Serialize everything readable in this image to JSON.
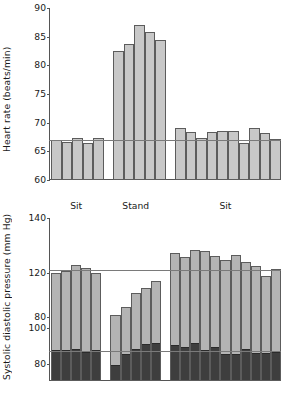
{
  "figure": {
    "panels": [
      "heart-rate",
      "blood-pressure"
    ],
    "phase_labels": [
      "Sit",
      "Stand",
      "Sit"
    ]
  },
  "chart_data": [
    {
      "type": "bar",
      "id": "heart-rate",
      "title": "",
      "xlabel": "",
      "ylabel": "Heart rate (beats/min)",
      "ylim": [
        60,
        90
      ],
      "yticks": [
        60,
        65,
        70,
        75,
        80,
        85,
        90
      ],
      "grid": false,
      "legend": "none",
      "reference_lines": [
        67.0
      ],
      "groups": [
        {
          "name": "Sit",
          "values": [
            67.0,
            66.7,
            67.3,
            66.5,
            67.3
          ]
        },
        {
          "name": "Stand",
          "values": [
            82.5,
            83.8,
            87.0,
            85.8,
            84.4
          ]
        },
        {
          "name": "Sit",
          "values": [
            69.1,
            68.4,
            67.3,
            68.4,
            68.6,
            68.6,
            66.5,
            69.0,
            68.2,
            67.1
          ]
        }
      ]
    },
    {
      "type": "bar",
      "id": "blood-pressure",
      "title": "",
      "xlabel": "",
      "ylabel": "Systolic diastolic pressure (mm Hg)",
      "stacked": true,
      "grid": false,
      "legend": "none",
      "broken_axis": true,
      "systolic_axis": {
        "ylim": [
          72,
          140
        ],
        "yticks": [
          80,
          100,
          120,
          140
        ]
      },
      "diastolic_axis": {
        "ylim": [
          72,
          92
        ],
        "yticks": [
          80
        ]
      },
      "reference_lines": [
        121.0,
        86.0
      ],
      "series": [
        {
          "name": "Systolic",
          "color": "#b4b4b4"
        },
        {
          "name": "Diastolic",
          "color": "#3e3e3e"
        }
      ],
      "groups": [
        {
          "name": "Sit",
          "systolic": [
            120.0,
            120.6,
            123.0,
            121.6,
            120.0
          ],
          "diastolic": [
            86.2,
            86.2,
            86.5,
            85.3,
            86.0
          ]
        },
        {
          "name": "Stand",
          "systolic": [
            104.6,
            107.6,
            112.8,
            114.3,
            117.0
          ],
          "diastolic": [
            79.3,
            84.3,
            86.8,
            89.2,
            89.3
          ]
        },
        {
          "name": "Sit",
          "systolic": [
            127.3,
            125.9,
            128.5,
            127.8,
            126.0,
            124.8,
            126.4,
            123.8,
            122.6,
            119.0,
            121.5
          ],
          "diastolic": [
            88.6,
            87.8,
            89.3,
            86.4,
            87.6,
            84.4,
            84.3,
            86.8,
            84.9,
            84.9,
            85.0
          ]
        }
      ]
    }
  ]
}
